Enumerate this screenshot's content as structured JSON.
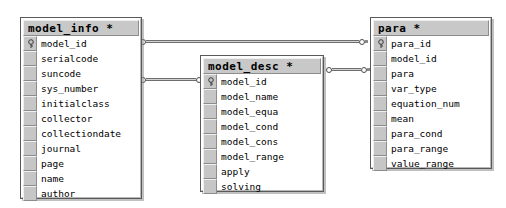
{
  "diagram": {
    "type": "entity-relationship-diagram",
    "background_color": "#ffffff",
    "header_color": "#c8c8c8",
    "gutter_color": "#c6c6c6",
    "border_color": "#5a5a5a"
  },
  "tables": [
    {
      "title": "model_info *",
      "fields": [
        {
          "name": "model_id",
          "key": true
        },
        {
          "name": "serialcode",
          "key": false
        },
        {
          "name": "suncode",
          "key": false
        },
        {
          "name": "sys_number",
          "key": false
        },
        {
          "name": "initialclass",
          "key": false
        },
        {
          "name": "collector",
          "key": false
        },
        {
          "name": "collectiondate",
          "key": false
        },
        {
          "name": "journal",
          "key": false
        },
        {
          "name": "page",
          "key": false
        },
        {
          "name": "name",
          "key": false
        },
        {
          "name": "author",
          "key": false
        }
      ]
    },
    {
      "title": "model_desc *",
      "fields": [
        {
          "name": "model_id",
          "key": true
        },
        {
          "name": "model_name",
          "key": false
        },
        {
          "name": "model_equa",
          "key": false
        },
        {
          "name": "model_cond",
          "key": false
        },
        {
          "name": "model_cons",
          "key": false
        },
        {
          "name": "model_range",
          "key": false
        },
        {
          "name": "apply",
          "key": false
        },
        {
          "name": "solving",
          "key": false
        }
      ]
    },
    {
      "title": "para *",
      "fields": [
        {
          "name": "para_id",
          "key": true
        },
        {
          "name": "model_id",
          "key": false
        },
        {
          "name": "para",
          "key": false
        },
        {
          "name": "var_type",
          "key": false
        },
        {
          "name": "equation_num",
          "key": false
        },
        {
          "name": "mean",
          "key": false
        },
        {
          "name": "para_cond",
          "key": false
        },
        {
          "name": "para_range",
          "key": false
        },
        {
          "name": "value_range",
          "key": false
        }
      ]
    }
  ],
  "relationships": [
    {
      "label": "model_info.model_id to para.para_id"
    },
    {
      "label": "model_info.sys_number to model_desc.model_id"
    },
    {
      "label": "model_desc to para.para"
    }
  ]
}
